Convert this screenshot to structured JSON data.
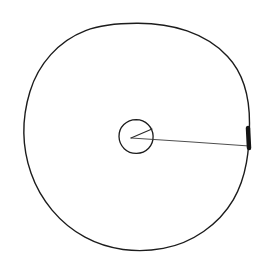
{
  "figure": {
    "background_color": "#ffffff",
    "width": 269,
    "height": 274,
    "style": "hand-drawn line sketch, black ink on white"
  },
  "chart_data": {
    "type": "diagram",
    "subtitle": "",
    "xlabel": "",
    "ylabel": "",
    "grid": false,
    "legend": null,
    "annotations": [],
    "elements": [
      {
        "name": "outer-circle",
        "shape": "circle",
        "center": [
          136.5,
          136.5
        ],
        "radius": 113,
        "stroke_color": "#1c1c1c",
        "stroke_width": 1.4,
        "fill": "none"
      },
      {
        "name": "inner-circle",
        "shape": "circle",
        "center": [
          136,
          136.5
        ],
        "radius": 17,
        "stroke_color": "#1c1c1c",
        "stroke_width": 1.3,
        "fill": "none"
      },
      {
        "name": "angle-upper-ray",
        "shape": "line",
        "from": [
          131,
          138
        ],
        "to": [
          152,
          129
        ],
        "stroke_color": "#2a2a2a",
        "stroke_width": 1.1
      },
      {
        "name": "radius-line",
        "shape": "line",
        "from": [
          131,
          138
        ],
        "to": [
          249,
          146
        ],
        "stroke_color": "#3a3a3a",
        "stroke_width": 0.9
      },
      {
        "name": "arc-tick-mark",
        "shape": "thick-segment",
        "from": [
          248,
          128
        ],
        "to": [
          249,
          148
        ],
        "stroke_color": "#141414",
        "stroke_width": 4.5
      }
    ],
    "colors": {
      "ink": "#1c1c1c",
      "ink_light": "#3a3a3a",
      "mark": "#141414",
      "background": "#ffffff"
    }
  }
}
